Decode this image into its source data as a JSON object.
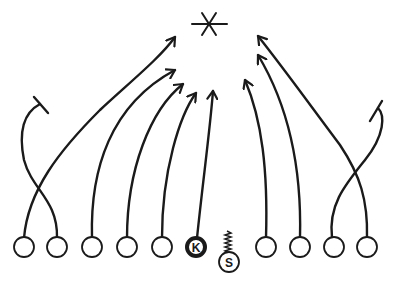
{
  "diagram": {
    "type": "football-kickoff-coverage",
    "ball_target_icon": "asterisk",
    "stroke_color": "#1a1a1a",
    "background": "#ffffff",
    "players": [
      {
        "id": "L5",
        "label": "",
        "role": "cover",
        "route": "cross-contain"
      },
      {
        "id": "L4",
        "label": "",
        "role": "cover",
        "route": "cross-deep"
      },
      {
        "id": "L3",
        "label": "",
        "role": "cover",
        "route": "arrow-to-ball"
      },
      {
        "id": "L2",
        "label": "",
        "role": "cover",
        "route": "arrow-to-ball"
      },
      {
        "id": "L1",
        "label": "",
        "role": "cover",
        "route": "arrow-to-ball"
      },
      {
        "id": "K",
        "label": "K",
        "role": "kicker",
        "route": "arrow-to-ball"
      },
      {
        "id": "S",
        "label": "S",
        "role": "safety",
        "route": "wavy-stay"
      },
      {
        "id": "R1",
        "label": "",
        "role": "cover",
        "route": "arrow-to-ball"
      },
      {
        "id": "R2",
        "label": "",
        "role": "cover",
        "route": "arrow-to-ball"
      },
      {
        "id": "R3",
        "label": "",
        "role": "cover",
        "route": "cross-deep"
      },
      {
        "id": "R4",
        "label": "",
        "role": "cover",
        "route": "cross-contain"
      }
    ]
  }
}
